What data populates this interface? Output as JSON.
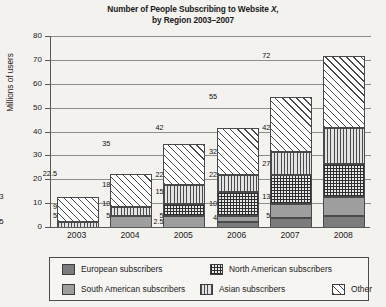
{
  "chart_data": {
    "type": "bar",
    "title": "Number of People Subscribing to Website X, by Region 2003–2007",
    "title_line1": "Number of People Subscribing to Website ",
    "title_line1_italic": "X,",
    "title_line2": "by Region 2003–2007",
    "xlabel": "",
    "ylabel": "Millions of users",
    "ylim": [
      0,
      80
    ],
    "yticks": [
      0,
      10,
      20,
      30,
      40,
      50,
      60,
      70,
      80
    ],
    "grid": true,
    "legend_position": "bottom",
    "stacked": true,
    "categories": [
      "2003",
      "2004",
      "2005",
      "2006",
      "2007",
      "2008"
    ],
    "series": [
      {
        "name": "European subscribers",
        "pattern": "solid-dark-grey",
        "color": "#7c7c7c",
        "values": [
          0,
          0,
          0,
          0,
          4,
          5
        ]
      },
      {
        "name": "South American subscribers",
        "pattern": "solid-light-grey",
        "color": "#9e9e9e",
        "values": [
          0,
          5,
          5,
          2.5,
          6,
          8
        ]
      },
      {
        "name": "North American subscribers",
        "pattern": "checkered",
        "color": "#e9e9e9",
        "values": [
          0,
          0,
          5,
          12.5,
          12,
          14
        ]
      },
      {
        "name": "Asian subscribers",
        "pattern": "vertical-lines",
        "color": "#e3e3e3",
        "values": [
          2.5,
          4,
          8,
          7,
          10,
          15
        ]
      },
      {
        "name": "Other",
        "pattern": "diagonal-hatch",
        "color": "#ffffff",
        "values": [
          10.5,
          13.5,
          17,
          20,
          23,
          30
        ]
      }
    ],
    "totals": [
      13,
      22.5,
      35,
      42,
      55,
      72
    ],
    "cumulative_labels": [
      {
        "category": "2003",
        "labels": [
          "2.5",
          "13"
        ]
      },
      {
        "category": "2004",
        "labels": [
          "5",
          "9",
          "22.5"
        ]
      },
      {
        "category": "2005",
        "labels": [
          "5",
          "10",
          "18",
          "35"
        ]
      },
      {
        "category": "2006",
        "labels": [
          "2.5",
          "5",
          "15",
          "22",
          "42"
        ]
      },
      {
        "category": "2007",
        "labels": [
          "4",
          "10",
          "22",
          "32",
          "55"
        ]
      },
      {
        "category": "2008",
        "labels": [
          "5",
          "13",
          "27",
          "42",
          "72"
        ]
      }
    ],
    "bars": [
      {
        "year": "2003",
        "total": 13,
        "segments": [
          {
            "name": "Asian subscribers",
            "from": 0,
            "to": 2.5,
            "label": "2.5"
          },
          {
            "name": "Other",
            "from": 2.5,
            "to": 13,
            "label": "13"
          }
        ]
      },
      {
        "year": "2004",
        "total": 22.5,
        "segments": [
          {
            "name": "South American subscribers",
            "from": 0,
            "to": 5,
            "label": "5"
          },
          {
            "name": "Asian subscribers",
            "from": 5,
            "to": 9,
            "label": "9"
          },
          {
            "name": "Other",
            "from": 9,
            "to": 22.5,
            "label": "22.5"
          }
        ]
      },
      {
        "year": "2005",
        "total": 35,
        "segments": [
          {
            "name": "South American subscribers",
            "from": 0,
            "to": 5,
            "label": "5"
          },
          {
            "name": "North American subscribers",
            "from": 5,
            "to": 10,
            "label": "10"
          },
          {
            "name": "Asian subscribers",
            "from": 10,
            "to": 18,
            "label": "18"
          },
          {
            "name": "Other",
            "from": 18,
            "to": 35,
            "label": "35"
          }
        ]
      },
      {
        "year": "2006",
        "total": 42,
        "segments": [
          {
            "name": "European subscribers",
            "from": 0,
            "to": 2.5,
            "label": "2.5"
          },
          {
            "name": "South American subscribers",
            "from": 2.5,
            "to": 5,
            "label": "5"
          },
          {
            "name": "North American subscribers",
            "from": 5,
            "to": 15,
            "label": "15"
          },
          {
            "name": "Asian subscribers",
            "from": 15,
            "to": 22,
            "label": "22"
          },
          {
            "name": "Other",
            "from": 22,
            "to": 42,
            "label": "42"
          }
        ]
      },
      {
        "year": "2007",
        "total": 55,
        "segments": [
          {
            "name": "European subscribers",
            "from": 0,
            "to": 4,
            "label": "4"
          },
          {
            "name": "South American subscribers",
            "from": 4,
            "to": 10,
            "label": "10"
          },
          {
            "name": "North American subscribers",
            "from": 10,
            "to": 22,
            "label": "22"
          },
          {
            "name": "Asian subscribers",
            "from": 22,
            "to": 32,
            "label": "32"
          },
          {
            "name": "Other",
            "from": 32,
            "to": 55,
            "label": "55"
          }
        ]
      },
      {
        "year": "2008",
        "total": 72,
        "segments": [
          {
            "name": "European subscribers",
            "from": 0,
            "to": 5,
            "label": "5"
          },
          {
            "name": "South American subscribers",
            "from": 5,
            "to": 13,
            "label": "13"
          },
          {
            "name": "North American subscribers",
            "from": 13,
            "to": 27,
            "label": "27"
          },
          {
            "name": "Asian subscribers",
            "from": 27,
            "to": 42,
            "label": "42"
          },
          {
            "name": "Other",
            "from": 42,
            "to": 72,
            "label": "72"
          }
        ]
      }
    ],
    "legend": [
      {
        "label": "European subscribers",
        "pattern": "solid-dark-grey"
      },
      {
        "label": "North American subscribers",
        "pattern": "checkered"
      },
      {
        "label": "South American subscribers",
        "pattern": "solid-light-grey"
      },
      {
        "label": "Asian subscribers",
        "pattern": "vertical-lines"
      },
      {
        "label": "Other",
        "pattern": "diagonal-hatch"
      }
    ]
  }
}
